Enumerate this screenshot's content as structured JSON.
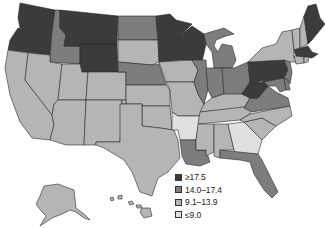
{
  "legend": {
    "items": [
      {
        "label": "≥17.5",
        "color": "#3b3b3b"
      },
      {
        "label": "14.0–17.4",
        "color": "#7d7d7d"
      },
      {
        "label": "9.1–13.9",
        "color": "#b5b5b5"
      },
      {
        "label": "≤9.0",
        "color": "#e0e0e0"
      }
    ]
  },
  "map": {
    "type": "choropleth",
    "region": "United States",
    "classes": {
      "c4": {
        "range": "≥17.5",
        "color": "#3b3b3b",
        "states": [
          "WA",
          "OR",
          "MT",
          "WY",
          "MN",
          "WI",
          "PA",
          "WV",
          "ME",
          "MA"
        ]
      },
      "c3": {
        "range": "14.0–17.4",
        "color": "#7d7d7d",
        "states": [
          "ID",
          "ND",
          "NE",
          "IL",
          "IN",
          "OH",
          "MI",
          "VA",
          "LA",
          "FL",
          "NJ",
          "MD",
          "DE"
        ]
      },
      "c2": {
        "range": "9.1–13.9",
        "color": "#b5b5b5",
        "states": [
          "CA",
          "NV",
          "UT",
          "AZ",
          "CO",
          "NM",
          "SD",
          "KS",
          "OK",
          "TX",
          "IA",
          "MO",
          "KY",
          "TN",
          "MS",
          "AL",
          "NC",
          "SC",
          "NY",
          "VT",
          "NH",
          "CT",
          "RI",
          "AK",
          "HI"
        ]
      },
      "c1": {
        "range": "≤9.0",
        "color": "#e0e0e0",
        "states": [
          "AR",
          "GA"
        ]
      }
    }
  }
}
